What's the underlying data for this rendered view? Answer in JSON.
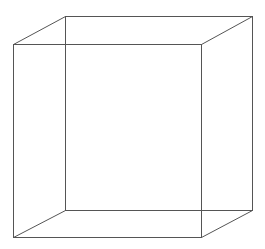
{
  "diagram": {
    "type": "wireframe-cube",
    "stroke_color": "#555555",
    "background": "#ffffff",
    "front_face": {
      "x1": 13,
      "y1": 44,
      "x2": 201,
      "y2": 237
    },
    "back_face": {
      "x1": 65,
      "y1": 16,
      "x2": 252,
      "y2": 210
    }
  }
}
